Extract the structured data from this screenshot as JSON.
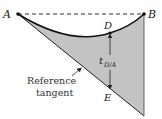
{
  "labels": {
    "A": "A",
    "B": "B",
    "D": "D",
    "E": "E",
    "t": "t",
    "t_sub": "D/A",
    "ref_line1": "Reference",
    "ref_line2": "tangent"
  },
  "colors": {
    "fill": "#c3c3c3",
    "stroke": "#1a1a1a"
  }
}
